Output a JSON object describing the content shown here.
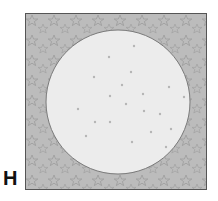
{
  "panel": {
    "label": "H",
    "description": "Square field with star-patterned gray background and a large light circular region containing scattered dots"
  },
  "colors": {
    "background_fill": "#b9b9b9",
    "star_stroke": "#9a9a9a",
    "circle_fill": "#ececec",
    "circle_stroke": "#7a7a7a",
    "dot_color": "#b5b5b5",
    "border": "#555555"
  },
  "shapes": {
    "circle": {
      "cx": 92,
      "cy": 88,
      "r": 72
    }
  }
}
